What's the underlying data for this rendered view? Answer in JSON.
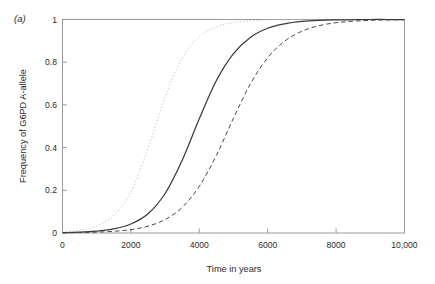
{
  "figure": {
    "panel_label": "(a)",
    "background_color": "#ffffff"
  },
  "chart_data": {
    "type": "line",
    "title": "",
    "panel": "(a)",
    "xlabel": "Time in years",
    "ylabel": "Frequency of G6PD A-allele",
    "xlim": [
      0,
      10000
    ],
    "ylim": [
      0,
      1
    ],
    "xticks": [
      0,
      2000,
      4000,
      6000,
      8000,
      10000
    ],
    "xticklabels": [
      "0",
      "2000",
      "4000",
      "6000",
      "8000",
      "10,000"
    ],
    "yticks": [
      0,
      0.2,
      0.4,
      0.6,
      0.8,
      1
    ],
    "yticklabels": [
      "0",
      "0.2",
      "0.4",
      "0.6",
      "0.8",
      "1"
    ],
    "grid": false,
    "legend": "none",
    "x": [
      0,
      500,
      1000,
      1500,
      2000,
      2500,
      3000,
      3500,
      4000,
      4500,
      5000,
      5500,
      6000,
      6500,
      7000,
      7500,
      8000,
      8500,
      9000,
      9500,
      10000
    ],
    "series": [
      {
        "name": "fastest selection",
        "linestyle": "dash-dot",
        "color": "#b9b9b9",
        "midpoint_years": 2470,
        "values": [
          0.005,
          0.013,
          0.033,
          0.082,
          0.193,
          0.395,
          0.637,
          0.82,
          0.92,
          0.966,
          0.986,
          0.994,
          0.998,
          0.999,
          1.0,
          1.0,
          1.0,
          1.0,
          1.0,
          1.0,
          1.0
        ]
      },
      {
        "name": "intermediate selection",
        "linestyle": "solid",
        "color": "#3a3a3a",
        "midpoint_years": 3630,
        "values": [
          0.002,
          0.004,
          0.009,
          0.019,
          0.042,
          0.09,
          0.185,
          0.341,
          0.535,
          0.714,
          0.84,
          0.917,
          0.959,
          0.98,
          0.991,
          0.996,
          0.998,
          0.999,
          1.0,
          1.0,
          1.0
        ]
      },
      {
        "name": "slowest selection",
        "linestyle": "dashed",
        "color": "#4a4a4a",
        "midpoint_years": 4830,
        "values": [
          0.001,
          0.002,
          0.004,
          0.008,
          0.016,
          0.032,
          0.063,
          0.12,
          0.219,
          0.364,
          0.538,
          0.7,
          0.821,
          0.899,
          0.945,
          0.971,
          0.985,
          0.992,
          0.996,
          0.998,
          0.999
        ]
      }
    ]
  },
  "axes": {
    "y_title": "Frequency of G6PD A-allele",
    "x_title": "Time in years",
    "y_tick_0": "0",
    "y_tick_1": "0.2",
    "y_tick_2": "0.4",
    "y_tick_3": "0.6",
    "y_tick_4": "0.8",
    "y_tick_5": "1",
    "x_tick_0": "0",
    "x_tick_1": "2000",
    "x_tick_2": "4000",
    "x_tick_3": "6000",
    "x_tick_4": "8000",
    "x_tick_5": "10,000"
  }
}
